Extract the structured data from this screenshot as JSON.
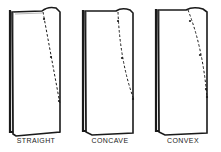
{
  "diagram": {
    "figures": [
      {
        "id": "straight",
        "label": "STRAIGHT",
        "line_type": "straight dashed line"
      },
      {
        "id": "concave",
        "label": "CONCAVE",
        "line_type": "concave dashed curve"
      },
      {
        "id": "convex",
        "label": "CONVEX",
        "line_type": "convex dashed curve"
      }
    ],
    "colors": {
      "ink": "#1a1a1a",
      "paper": "#ffffff",
      "fold_shade": "#e8e8e8"
    }
  }
}
